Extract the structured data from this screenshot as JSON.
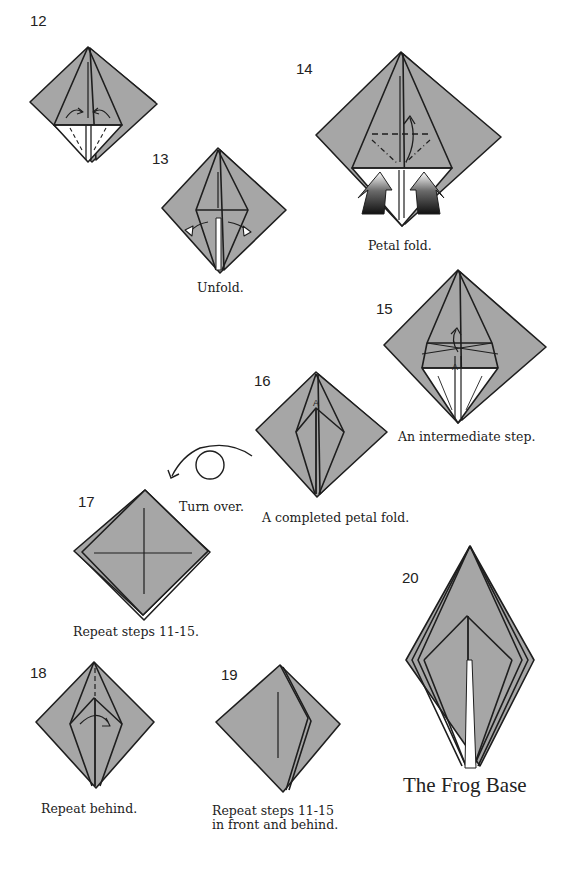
{
  "colors": {
    "paper": "#a6a6a6",
    "line": "#1e1e1e",
    "background": "#ffffff",
    "white_layer": "#ffffff"
  },
  "steps": [
    {
      "number": "12",
      "caption": ""
    },
    {
      "number": "13",
      "caption": "Unfold."
    },
    {
      "number": "14",
      "caption": "Petal fold."
    },
    {
      "number": "15",
      "caption": "An intermediate step."
    },
    {
      "number": "16",
      "caption": "A completed petal fold."
    },
    {
      "number": "17",
      "caption": "Repeat steps 11-15."
    },
    {
      "number": "18",
      "caption": "Repeat behind."
    },
    {
      "number": "19",
      "caption_line1": "Repeat steps 11-15",
      "caption_line2": "in front and behind."
    },
    {
      "number": "20",
      "caption": "The Frog Base"
    }
  ],
  "turn_over": {
    "label": "Turn over.",
    "icon": "turn-over-icon"
  },
  "markers": {
    "point_label": "A"
  }
}
